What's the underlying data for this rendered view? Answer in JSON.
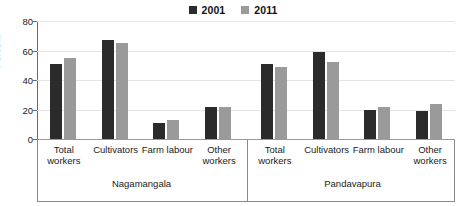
{
  "chart_data": {
    "type": "bar",
    "title": "",
    "xlabel": "",
    "ylabel": "Percent",
    "ylim": [
      0,
      80
    ],
    "yticks": [
      "0",
      "20",
      "40",
      "60",
      "80"
    ],
    "grid": true,
    "legend_position": "top-center",
    "legend": [
      {
        "name": "2001",
        "color": "#2b2b2b"
      },
      {
        "name": "2011",
        "color": "#9a9a9a"
      }
    ],
    "groups": [
      {
        "name": "Nagamangala",
        "categories": [
          "Total workers",
          "Cultivators",
          "Farm labour",
          "Other workers"
        ],
        "series": [
          {
            "name": "2001",
            "values": [
              51,
              67,
              11,
              22
            ]
          },
          {
            "name": "2011",
            "values": [
              55,
              65,
              13,
              22
            ]
          }
        ]
      },
      {
        "name": "Pandavapura",
        "categories": [
          "Total workers",
          "Cultivators",
          "Farm labour",
          "Other workers"
        ],
        "series": [
          {
            "name": "2001",
            "values": [
              51,
              59,
              20,
              19
            ]
          },
          {
            "name": "2011",
            "values": [
              49,
              52,
              22,
              24
            ]
          }
        ]
      }
    ],
    "categories_wrapped": [
      [
        "Total workers"
      ],
      [
        "Cultivators"
      ],
      [
        "Farm labour"
      ],
      [
        "Other",
        "workers"
      ],
      [
        "Total workers"
      ],
      [
        "Cultivators"
      ],
      [
        "Farm labour"
      ],
      [
        "Other",
        "workers"
      ]
    ]
  },
  "colors": {
    "series_2001": "#2b2b2b",
    "series_2011": "#9a9a9a",
    "gridline": "#e4e4e4",
    "axis": "#6b6b6b",
    "frame": "#8a8a8a",
    "background": "#ffffff"
  }
}
